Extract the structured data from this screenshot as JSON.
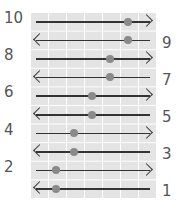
{
  "rows": [
    {
      "label": "10",
      "side": "left",
      "direction": "right",
      "dot_x": 128
    },
    {
      "label": "9",
      "side": "right",
      "direction": "left",
      "dot_x": 128
    },
    {
      "label": "8",
      "side": "left",
      "direction": "right",
      "dot_x": 110
    },
    {
      "label": "7",
      "side": "right",
      "direction": "left",
      "dot_x": 110
    },
    {
      "label": "6",
      "side": "left",
      "direction": "right",
      "dot_x": 92
    },
    {
      "label": "5",
      "side": "right",
      "direction": "left",
      "dot_x": 92
    },
    {
      "label": "4",
      "side": "left",
      "direction": "right",
      "dot_x": 74
    },
    {
      "label": "3",
      "side": "right",
      "direction": "left",
      "dot_x": 74
    },
    {
      "label": "2",
      "side": "left",
      "direction": "right",
      "dot_x": 56
    },
    {
      "label": "1",
      "side": "right",
      "direction": "left",
      "dot_x": 56
    }
  ],
  "colors": {
    "grid": "#e4e4e4",
    "arrow": "#333333",
    "dot": "#8a8a8a",
    "label": "#555555"
  }
}
